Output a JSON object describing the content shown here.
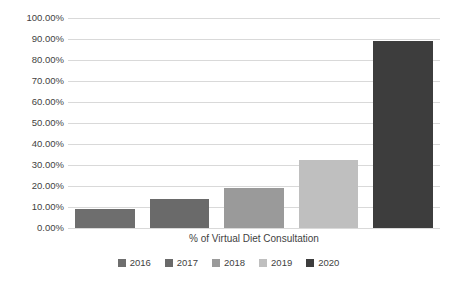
{
  "chart_data": {
    "type": "bar",
    "title": "",
    "subtitle": "",
    "xlabel": "% of Virtual Diet Consultation",
    "ylabel": "",
    "categories": [
      "2016",
      "2017",
      "2018",
      "2019",
      "2020"
    ],
    "values": [
      9,
      14,
      19,
      32.5,
      89
    ],
    "value_labels": [
      "9.00%",
      "14.00%",
      "19.00%",
      "32.50%",
      "89.00%"
    ],
    "series": [
      {
        "name": "% of Virtual Diet Consultation",
        "values": [
          9,
          14,
          19,
          32.5,
          89
        ]
      }
    ],
    "ylim": [
      0,
      100
    ],
    "ytick_step": 10,
    "ytick_labels": [
      "100.00%",
      "90.00%",
      "80.00%",
      "70.00%",
      "60.00%",
      "50.00%",
      "40.00%",
      "30.00%",
      "20.00%",
      "10.00%",
      "0.00%"
    ],
    "ytick_values": [
      100,
      90,
      80,
      70,
      60,
      50,
      40,
      30,
      20,
      10,
      0
    ],
    "grid": true,
    "grid_axis": "y",
    "legend_position": "bottom",
    "bar_colors": [
      "#6e6e6e",
      "#6a6a6a",
      "#9a9a9a",
      "#bfbfbf",
      "#3d3d3d"
    ],
    "gridline_color": "#d9d9d9",
    "background_color": "#ffffff",
    "text_color": "#3f3f3f"
  },
  "legend": {
    "items": [
      {
        "label": "2016",
        "color": "#6e6e6e"
      },
      {
        "label": "2017",
        "color": "#6a6a6a"
      },
      {
        "label": "2018",
        "color": "#9a9a9a"
      },
      {
        "label": "2019",
        "color": "#bfbfbf"
      },
      {
        "label": "2020",
        "color": "#3d3d3d"
      }
    ]
  }
}
